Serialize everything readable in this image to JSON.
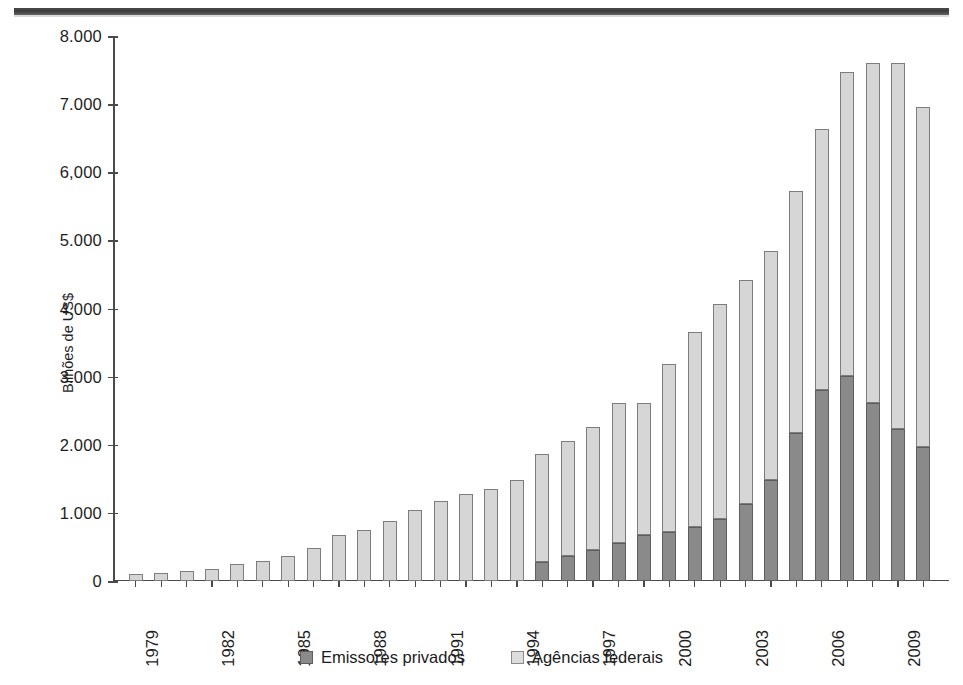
{
  "page": {
    "rule_name": "page-top-rule"
  },
  "chart_data": {
    "type": "bar",
    "subtype": "stacked",
    "title": "",
    "xlabel": "",
    "ylabel": "Bilhões de US$",
    "ylim": [
      0,
      8000
    ],
    "ytick_values": [
      0,
      1000,
      2000,
      3000,
      4000,
      5000,
      6000,
      7000,
      8000
    ],
    "ytick_labels": [
      "0",
      "1.000",
      "2.000",
      "3.000",
      "4.000",
      "5.000",
      "6,000",
      "7.000",
      "8.000"
    ],
    "grid": false,
    "legend_position": "bottom-center",
    "xtick_label_rotation": -90,
    "xtick_label_step": 3,
    "categories": [
      "1979",
      "1980",
      "1981",
      "1982",
      "1983",
      "1984",
      "1985",
      "1986",
      "1987",
      "1988",
      "1989",
      "1990",
      "1991",
      "1992",
      "1993",
      "1994",
      "1995",
      "1996",
      "1997",
      "1998",
      "1999",
      "2000",
      "2001",
      "2002",
      "2003",
      "2004",
      "2005",
      "2006",
      "2007",
      "2008",
      "2009",
      "2010"
    ],
    "visible_xtick_labels": [
      "1979",
      "1982",
      "1985",
      "1988",
      "1991",
      "1994",
      "1997",
      "2000",
      "2003",
      "2006",
      "2009"
    ],
    "series": [
      {
        "name": "Emissores privados",
        "color": "#8a8a8a",
        "values": [
          0,
          0,
          0,
          0,
          0,
          0,
          0,
          0,
          0,
          0,
          0,
          0,
          0,
          0,
          0,
          0,
          280,
          360,
          450,
          560,
          680,
          720,
          800,
          910,
          1130,
          1480,
          2170,
          2800,
          3010,
          2620,
          2230,
          1960
        ]
      },
      {
        "name": "Agências federais",
        "color": "#d6d6d6",
        "values": [
          110,
          120,
          140,
          180,
          250,
          290,
          370,
          480,
          670,
          750,
          880,
          1040,
          1180,
          1280,
          1350,
          1490,
          1590,
          1700,
          1810,
          2050,
          1930,
          2470,
          2860,
          3150,
          3290,
          3370,
          3550,
          3830,
          4460,
          4990,
          5380,
          5000
        ]
      }
    ],
    "totals": [
      110,
      120,
      140,
      180,
      250,
      290,
      370,
      480,
      670,
      750,
      880,
      1040,
      1180,
      1280,
      1350,
      1490,
      1870,
      2060,
      2260,
      2610,
      2610,
      3190,
      3660,
      4060,
      4420,
      4850,
      5720,
      6630,
      7470,
      7610,
      7610,
      6960
    ]
  },
  "legend": {
    "items": [
      {
        "label": "Emissores privados",
        "swatch": "swatch-private"
      },
      {
        "label": "Agências federais",
        "swatch": "swatch-federal"
      }
    ]
  }
}
